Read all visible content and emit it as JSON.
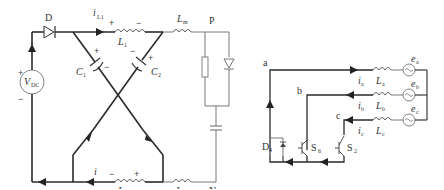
{
  "left_circuit": {
    "title": "Z-source network",
    "source": {
      "label": "V",
      "sub": "DC",
      "plus": "+",
      "minus": "−"
    },
    "diode": {
      "label": "D"
    },
    "currents": {
      "top": {
        "label": "i",
        "sub": "L1"
      },
      "bottom": {
        "label": "i",
        "sub": "L2"
      }
    },
    "inductors": {
      "L1": {
        "label": "L",
        "sub": "1",
        "plus": "+",
        "minus": "−"
      },
      "L2": {
        "label": "L",
        "sub": "2",
        "plus": "+",
        "minus": "−"
      },
      "Lm_top": {
        "label": "L",
        "sub": "m"
      },
      "Lm_bottom": {
        "label": "L",
        "sub": "m"
      }
    },
    "capacitors": {
      "C1": {
        "label": "C",
        "sub": "1",
        "plus": "+",
        "minus": "−"
      },
      "C2": {
        "label": "C",
        "sub": "2",
        "plus": "+",
        "minus": "−"
      }
    },
    "nodes": {
      "P": "P",
      "N": "N"
    }
  },
  "right_circuit": {
    "title": "Three-phase equivalent",
    "nodes": {
      "a": "a",
      "b": "b",
      "c": "c"
    },
    "phases": [
      {
        "current": "i",
        "current_sub": "a",
        "inductor": "L",
        "inductor_sub": "a",
        "source": "e",
        "source_sub": "a"
      },
      {
        "current": "i",
        "current_sub": "b",
        "inductor": "L",
        "inductor_sub": "b",
        "source": "e",
        "source_sub": "b"
      },
      {
        "current": "i",
        "current_sub": "c",
        "inductor": "L",
        "inductor_sub": "c",
        "source": "e",
        "source_sub": "c"
      }
    ],
    "switches": {
      "D4": {
        "label": "D",
        "sub": "4"
      },
      "S6": {
        "label": "S",
        "sub": "6"
      },
      "S2": {
        "label": "S",
        "sub": "2"
      }
    }
  }
}
